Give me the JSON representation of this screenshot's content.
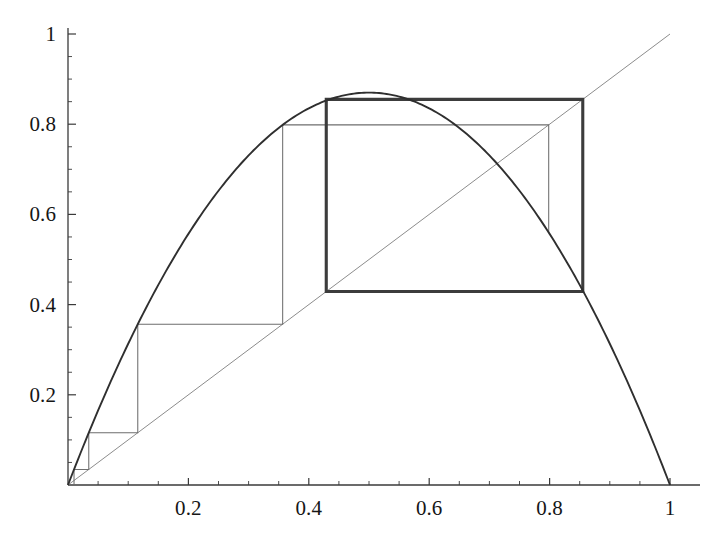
{
  "figure": {
    "name": "cobweb-diagram",
    "background_color": "#ffffff",
    "axis_color": "#3a3a3a",
    "curve_color": "#2f2f2f",
    "diagonal_color": "#8c8c8c",
    "cobweb_light_color": "#6e6e6e",
    "cobweb_heavy_color": "#3c3c3c"
  },
  "axes": {
    "x": {
      "min": 0,
      "max": 1.04,
      "ticks_major": [
        0.2,
        0.4,
        0.6,
        0.8,
        1
      ],
      "tick_labels": [
        "0.2",
        "0.4",
        "0.6",
        "0.8",
        "1"
      ],
      "minor_step": 0.05,
      "axis_y_value": 0,
      "label": ""
    },
    "y": {
      "min": 0,
      "max": 1.0,
      "ticks_major": [
        0.2,
        0.4,
        0.6,
        0.8,
        1
      ],
      "tick_labels": [
        "0.2",
        "0.4",
        "0.6",
        "0.8",
        "1"
      ],
      "minor_step": 0.05,
      "axis_x_value": 0,
      "label": ""
    },
    "grid": "off",
    "legend": "none"
  },
  "chart_data": {
    "type": "line",
    "title": "",
    "subtitle": "",
    "xlabel": "",
    "ylabel": "",
    "xlim": [
      0,
      1.04
    ],
    "ylim": [
      0,
      1.0
    ],
    "grid": false,
    "legend_position": "none",
    "series": [
      {
        "name": "logistic-map-curve",
        "kind": "function",
        "expression": "f(x) = r*x*(1-x)",
        "parameter_r": 3.48,
        "vertex": {
          "x": 0.5,
          "y": 0.87
        },
        "roots": [
          0.0,
          1.0
        ],
        "color": "#2f2f2f",
        "line_width": 1.9,
        "x": [
          0.0,
          0.05,
          0.1,
          0.15,
          0.2,
          0.25,
          0.3,
          0.35,
          0.4,
          0.45,
          0.5,
          0.55,
          0.6,
          0.65,
          0.7,
          0.75,
          0.8,
          0.85,
          0.9,
          0.95,
          1.0
        ],
        "values": [
          0.0,
          0.1653,
          0.3132,
          0.4437,
          0.5568,
          0.6525,
          0.7308,
          0.7917,
          0.8352,
          0.8613,
          0.87,
          0.8613,
          0.8352,
          0.7917,
          0.7308,
          0.6525,
          0.5568,
          0.4437,
          0.3132,
          0.1653,
          0.0
        ]
      },
      {
        "name": "identity-line",
        "kind": "function",
        "expression": "y = x",
        "color": "#8c8c8c",
        "line_width": 1.0,
        "x": [
          0,
          1
        ],
        "values": [
          0,
          1
        ]
      },
      {
        "name": "cobweb-orbit",
        "kind": "cobweb",
        "x0": 0.01,
        "iterates": [
          0.01,
          0.0345,
          0.1159,
          0.3566,
          0.7985,
          0.5598,
          0.8577,
          0.4246,
          0.8501,
          0.4434,
          0.859,
          0.4211,
          0.8488
        ],
        "limit_cycle": {
          "period": 2,
          "low": 0.429,
          "high": 0.8551
        },
        "color_early": "#6e6e6e",
        "color_attractor": "#3c3c3c"
      }
    ],
    "annotations": []
  }
}
